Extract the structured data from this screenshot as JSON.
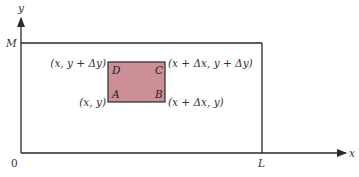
{
  "axes": {
    "x_label": "x",
    "y_label": "y",
    "origin_label": "0",
    "x_bound_label": "L",
    "y_bound_label": "M"
  },
  "rectangle": {
    "fill_color": "#cc8f98",
    "stroke_color": "#2a2a2a",
    "corners": {
      "A": {
        "letter": "A",
        "coord": "(x, y)"
      },
      "B": {
        "letter": "B",
        "coord": "(x + Δx, y)"
      },
      "C": {
        "letter": "C",
        "coord": "(x + Δx, y + Δy)"
      },
      "D": {
        "letter": "D",
        "coord": "(x, y + Δy)"
      }
    }
  },
  "colors": {
    "line": "#2a2a2a",
    "text": "#333333",
    "background": "#ffffff"
  }
}
